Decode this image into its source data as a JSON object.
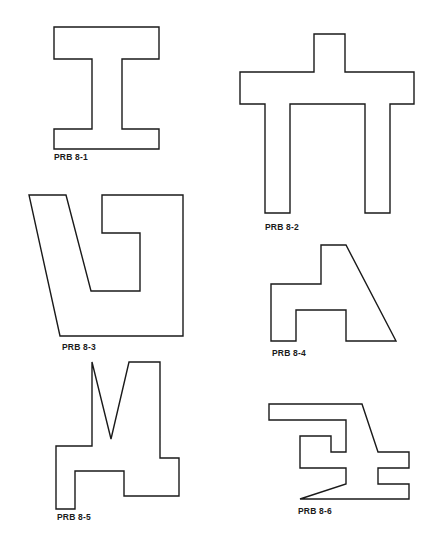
{
  "figures": [
    {
      "id": "8-1",
      "label": "PRB 8-1",
      "label_pos": [
        54,
        152
      ],
      "points": "54,27 159,27 159,59 122,59 122,129 159,129 159,149 54,149 54,129 92,129 92,59 54,59"
    },
    {
      "id": "8-2",
      "label": "PRB 8-2",
      "label_pos": [
        265,
        222
      ],
      "points": "314,34 345,34 345,72 414,72 414,104 390,104 390,213 365,213 365,104 290,104 290,213 265,213 265,104 240,104 240,72 314,72"
    },
    {
      "id": "8-3",
      "label": "PRB 8-3",
      "label_pos": [
        62,
        342
      ],
      "points": "29,195 66,195 91,291 140,291 140,233 102,233 102,195 183,195 183,336 60,336"
    },
    {
      "id": "8-4",
      "label": "PRB 8-4",
      "label_pos": [
        272,
        348
      ],
      "points": "321,245 346,245 396,341 346,341 346,310 296,310 296,341 271,341 271,284 321,284"
    },
    {
      "id": "8-5",
      "label": "PRB 8-5",
      "label_pos": [
        57,
        512
      ],
      "points": "92,362 111,439 129,362 160,362 160,458 179,458 179,496 124,496 124,471 75,471 75,509 56,509 56,446 92,446"
    },
    {
      "id": "8-6",
      "label": "PRB 8-6",
      "label_pos": [
        298,
        506
      ],
      "points": "269,404 362,404 378,452 409,452 409,468 378,468 378,484 409,484 409,499 300,499 346,484 346,468 300,468 300,436 331,436 331,452 346,452 346,420 269,420"
    }
  ],
  "labels": {
    "f1": "PRB 8-1",
    "f2": "PRB 8-2",
    "f3": "PRB 8-3",
    "f4": "PRB 8-4",
    "f5": "PRB 8-5",
    "f6": "PRB 8-6"
  },
  "colors": {
    "stroke": "#1a1a1a",
    "background": "#ffffff"
  }
}
